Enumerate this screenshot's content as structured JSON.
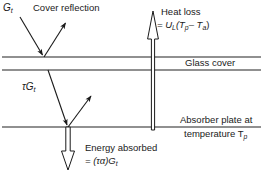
{
  "diagram": {
    "colors": {
      "line": "#6b6b6b",
      "ray": "#1a1a1a",
      "text": "#1a1a1a",
      "background": "#ffffff",
      "arrow_outline": "#1a1a1a",
      "arrow_fill": "#ffffff"
    },
    "labels": {
      "incident_irradiance": "G",
      "incident_irradiance_sub": "t",
      "cover_reflection": "Cover reflection",
      "heat_loss": "Heat loss",
      "heat_loss_eq_prefix": "= U",
      "heat_loss_eq_sub1": "L",
      "heat_loss_eq_open": "(T",
      "heat_loss_eq_sub2": "p",
      "heat_loss_eq_minus": "– T",
      "heat_loss_eq_sub3": "a",
      "heat_loss_eq_close": ")",
      "transmitted": "τG",
      "transmitted_sub": "t",
      "glass_cover": "Glass cover",
      "absorber_plate": "Absorber plate at",
      "temperature_prefix": "temperature T",
      "temperature_sub": "p",
      "energy_absorbed": "Energy absorbed",
      "energy_eq_prefix": "= (τα)G",
      "energy_eq_sub": "t"
    },
    "geometry": {
      "glass_top_y": 57,
      "glass_bottom_y": 70,
      "absorber_y": 127,
      "line_left_x": 2,
      "line_right_x": 261
    },
    "rays": [
      {
        "name": "incident-beam",
        "from": [
          20,
          17
        ],
        "to": [
          44,
          57
        ]
      },
      {
        "name": "cover-reflected-beam",
        "from": [
          44,
          57
        ],
        "to": [
          67,
          21
        ]
      },
      {
        "name": "transmitted-beam",
        "from": [
          48,
          70
        ],
        "to": [
          68,
          127
        ]
      },
      {
        "name": "plate-reflected-beam",
        "from": [
          68,
          127
        ],
        "to": [
          93,
          94
        ]
      }
    ],
    "block_arrows": [
      {
        "name": "heat-loss-arrow",
        "direction": "up",
        "x": 153,
        "from_y": 130,
        "to_y": 11
      },
      {
        "name": "energy-absorbed-arrow",
        "direction": "down",
        "x": 68,
        "from_y": 127,
        "to_y": 170
      }
    ]
  }
}
